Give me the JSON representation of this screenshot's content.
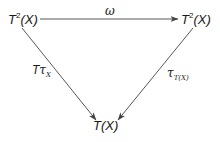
{
  "diagram": {
    "type": "commutative-triangle",
    "nodes": {
      "top_left": {
        "base": "T",
        "sup": "2",
        "arg": "(X)"
      },
      "top_right": {
        "base": "T",
        "sup": "2",
        "arg": "(X)"
      },
      "bottom": {
        "base": "T",
        "arg": "(X)"
      }
    },
    "arrows": {
      "top": {
        "from": "top_left",
        "to": "top_right",
        "label": "ω"
      },
      "left": {
        "from": "top_left",
        "to": "bottom",
        "label_main": "T",
        "label_greek": "τ",
        "label_sub": "X"
      },
      "right": {
        "from": "top_right",
        "to": "bottom",
        "label_greek": "τ",
        "label_sub": "T(X)"
      }
    },
    "colors": {
      "stroke": "#444444",
      "text": "#1a1a1a",
      "background": "#ffffff"
    }
  }
}
